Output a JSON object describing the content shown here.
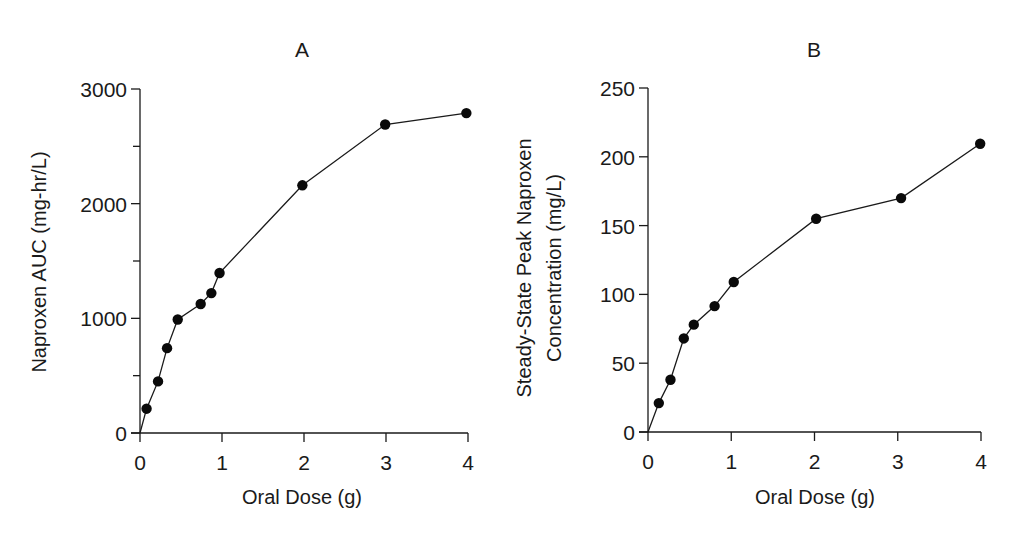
{
  "chart_data": [
    {
      "type": "line",
      "panel": "A",
      "title": "A",
      "xlabel": "Oral Dose (g)",
      "ylabel": "Naproxen AUC (mg-hr/L)",
      "xlim": [
        0,
        4
      ],
      "ylim": [
        0,
        3000
      ],
      "xticks": [
        0,
        1,
        2,
        3,
        4
      ],
      "xtick_labels": [
        "0",
        "1",
        "2",
        "3",
        "4"
      ],
      "yticks": [
        0,
        1000,
        2000,
        3000
      ],
      "ytick_labels": [
        "0",
        "1000",
        "2000",
        "3000"
      ],
      "yminor_ticks": [
        500,
        1500,
        2500
      ],
      "grid": false,
      "legend": null,
      "series": [
        {
          "name": "Naproxen AUC",
          "x": [
            0,
            0.08,
            0.22,
            0.33,
            0.46,
            0.74,
            0.87,
            0.97,
            1.98,
            2.99,
            3.98
          ],
          "y": [
            0,
            212,
            450,
            740,
            990,
            1125,
            1220,
            1395,
            2160,
            2690,
            2790
          ],
          "markers": [
            false,
            true,
            true,
            true,
            true,
            true,
            true,
            true,
            true,
            true,
            true
          ]
        }
      ]
    },
    {
      "type": "line",
      "panel": "B",
      "title": "B",
      "xlabel": "Oral Dose (g)",
      "ylabel": [
        "Steady-State Peak Naproxen",
        "Concentration (mg/L)"
      ],
      "xlim": [
        0,
        4
      ],
      "ylim": [
        0,
        250
      ],
      "xticks": [
        0,
        1,
        2,
        3,
        4
      ],
      "xtick_labels": [
        "0",
        "1",
        "2",
        "3",
        "4"
      ],
      "yticks": [
        0,
        50,
        100,
        150,
        200,
        250
      ],
      "ytick_labels": [
        "0",
        "50",
        "100",
        "150",
        "200",
        "250"
      ],
      "grid": false,
      "legend": null,
      "series": [
        {
          "name": "Steady-State Peak Naproxen Concentration",
          "x": [
            0,
            0.13,
            0.27,
            0.43,
            0.55,
            0.8,
            1.03,
            2.02,
            3.04,
            3.99
          ],
          "y": [
            0,
            21,
            38,
            68,
            78,
            91.5,
            109,
            155,
            170,
            209.5
          ],
          "markers": [
            false,
            true,
            true,
            true,
            true,
            true,
            true,
            true,
            true,
            true
          ]
        }
      ]
    }
  ],
  "layout": [
    {
      "plot": {
        "x0": 140,
        "x1": 468,
        "y0": 433,
        "y1": 89
      },
      "title_pos": [
        302,
        57
      ],
      "ylabel_x": 40,
      "ylabel_cy": 262,
      "xlabel_pos": [
        302,
        500
      ]
    },
    {
      "plot": {
        "x0": 648,
        "x1": 981,
        "y0": 432,
        "y1": 88
      },
      "title_pos": [
        814,
        57
      ],
      "ylabel_x": [
        524,
        554
      ],
      "ylabel_cy": 268,
      "xlabel_pos": [
        815,
        500
      ]
    }
  ]
}
